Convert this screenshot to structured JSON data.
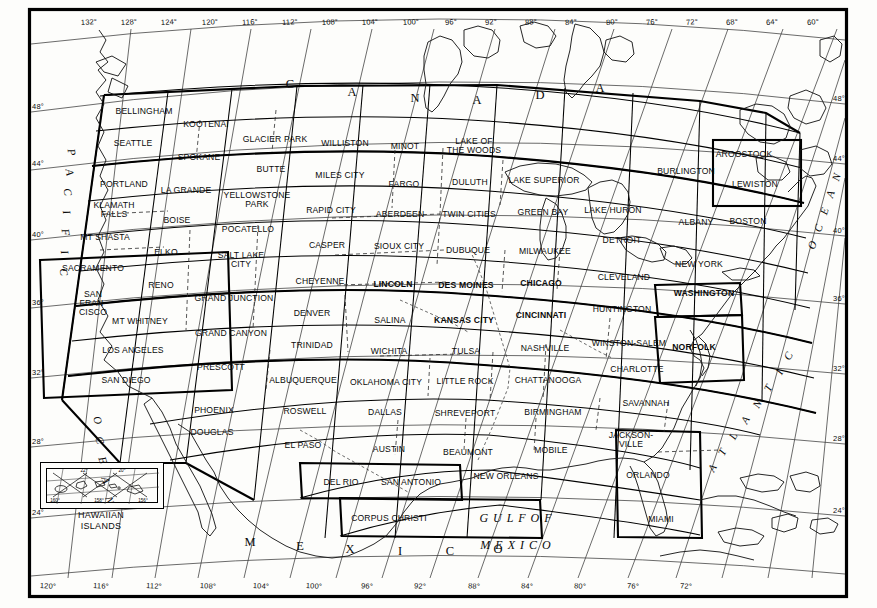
{
  "document": {
    "kind": "sectional-aeronautical-chart-index-map",
    "projection": "lambert-conformal-conic"
  },
  "graticule": {
    "longitude_top": [
      "132°",
      "128°",
      "124°",
      "120°",
      "116°",
      "112°",
      "108°",
      "104°",
      "100°",
      "96°",
      "92°",
      "88°",
      "84°",
      "80°",
      "76°",
      "72°",
      "68°",
      "64°",
      "60°"
    ],
    "longitude_bottom": [
      "120°",
      "116°",
      "112°",
      "108°",
      "104°",
      "100°",
      "96°",
      "92°",
      "88°",
      "84°",
      "80°",
      "76°",
      "72°"
    ],
    "latitude_left": [
      "48°",
      "44°",
      "40°",
      "36°",
      "32°",
      "28°",
      "24°"
    ],
    "latitude_right": [
      "48°",
      "44°",
      "40°",
      "36°",
      "32°",
      "28°",
      "24°"
    ]
  },
  "region_labels": {
    "canada": [
      "C",
      "A",
      "N",
      "A",
      "D",
      "A"
    ],
    "mexico": [
      "M",
      "E",
      "X",
      "I",
      "C",
      "O"
    ],
    "gulf_line1": "G U L F   O F",
    "gulf_line2": "M E X I C O",
    "pacific": [
      "P",
      "A",
      "C",
      "I",
      "F",
      "I",
      "C",
      "O",
      "C",
      "E",
      "A",
      "N"
    ],
    "atlantic_left": [
      "A",
      "T",
      "L",
      "A",
      "N",
      "T",
      "I",
      "C"
    ],
    "atlantic_right": [
      "O",
      "C",
      "E",
      "A",
      "N"
    ]
  },
  "inset": {
    "title_line1": "HAWAIIAN",
    "title_line2": "ISLANDS",
    "ticks_top": [
      "22°",
      "20°"
    ],
    "ticks_bottom": [
      "160°",
      "158°",
      "156°"
    ]
  },
  "charts": [
    {
      "name": "BELLINGHAM",
      "x": 144,
      "y": 111,
      "bold": false
    },
    {
      "name": "KOOTENAI",
      "x": 206,
      "y": 124,
      "bold": false
    },
    {
      "name": "GLACIER PARK",
      "x": 275,
      "y": 139,
      "bold": false
    },
    {
      "name": "WILLISTON",
      "x": 345,
      "y": 143,
      "bold": false
    },
    {
      "name": "MINOT",
      "x": 405,
      "y": 146,
      "bold": false
    },
    {
      "name": "LAKE OF",
      "x": 474,
      "y": 145,
      "bold": false,
      "line2": "THE WOODS"
    },
    {
      "name": "AROOSTOOK",
      "x": 744,
      "y": 154,
      "bold": false
    },
    {
      "name": "SEATTLE",
      "x": 133,
      "y": 143,
      "bold": false
    },
    {
      "name": "SPOKANE",
      "x": 199,
      "y": 157,
      "bold": false
    },
    {
      "name": "BUTTE",
      "x": 271,
      "y": 169,
      "bold": false
    },
    {
      "name": "MILES CITY",
      "x": 340,
      "y": 175,
      "bold": false
    },
    {
      "name": "FARGO",
      "x": 404,
      "y": 184,
      "bold": false
    },
    {
      "name": "DULUTH",
      "x": 470,
      "y": 182,
      "bold": false
    },
    {
      "name": "LAKE SUPERIOR",
      "x": 544,
      "y": 180,
      "bold": false
    },
    {
      "name": "BURLINGTON",
      "x": 686,
      "y": 171,
      "bold": false
    },
    {
      "name": "LEWISTON",
      "x": 755,
      "y": 184,
      "bold": false
    },
    {
      "name": "PORTLAND",
      "x": 124,
      "y": 184,
      "bold": false
    },
    {
      "name": "LA GRANDE",
      "x": 186,
      "y": 190,
      "bold": false
    },
    {
      "name": "YELLOWSTONE",
      "x": 257,
      "y": 199,
      "bold": false,
      "line2": "PARK"
    },
    {
      "name": "RAPID CITY",
      "x": 331,
      "y": 210,
      "bold": false
    },
    {
      "name": "ABERDEEN",
      "x": 400,
      "y": 214,
      "bold": false
    },
    {
      "name": "TWIN CITIES",
      "x": 469,
      "y": 214,
      "bold": false
    },
    {
      "name": "GREEN BAY",
      "x": 543,
      "y": 212,
      "bold": false
    },
    {
      "name": "LAKE HURON",
      "x": 613,
      "y": 210,
      "bold": false
    },
    {
      "name": "ALBANY",
      "x": 696,
      "y": 222,
      "bold": false
    },
    {
      "name": "BOSTON",
      "x": 748,
      "y": 221,
      "bold": false
    },
    {
      "name": "KLAMATH",
      "x": 114,
      "y": 209,
      "bold": false,
      "line2": "FALLS"
    },
    {
      "name": "BOISE",
      "x": 177,
      "y": 220,
      "bold": false
    },
    {
      "name": "POCATELLO",
      "x": 248,
      "y": 229,
      "bold": false
    },
    {
      "name": "CASPER",
      "x": 327,
      "y": 245,
      "bold": false
    },
    {
      "name": "SIOUX CITY",
      "x": 399,
      "y": 246,
      "bold": false
    },
    {
      "name": "DUBUQUE",
      "x": 468,
      "y": 250,
      "bold": false
    },
    {
      "name": "MILWAUKEE",
      "x": 545,
      "y": 251,
      "bold": false
    },
    {
      "name": "DETROIT",
      "x": 622,
      "y": 240,
      "bold": false
    },
    {
      "name": "NEW YORK",
      "x": 699,
      "y": 264,
      "bold": false
    },
    {
      "name": "MT SHASTA",
      "x": 105,
      "y": 237,
      "bold": false
    },
    {
      "name": "ELKO",
      "x": 166,
      "y": 252,
      "bold": false
    },
    {
      "name": "SALT LAKE",
      "x": 241,
      "y": 259,
      "bold": false,
      "line2": "CITY"
    },
    {
      "name": "CHEYENNE",
      "x": 320,
      "y": 281,
      "bold": false
    },
    {
      "name": "LINCOLN",
      "x": 393,
      "y": 284,
      "bold": true
    },
    {
      "name": "DES MOINES",
      "x": 466,
      "y": 285,
      "bold": true
    },
    {
      "name": "CHICAGO",
      "x": 541,
      "y": 283,
      "bold": true
    },
    {
      "name": "CLEVELAND",
      "x": 624,
      "y": 277,
      "bold": false
    },
    {
      "name": "WASHINGTON",
      "x": 704,
      "y": 293,
      "bold": true
    },
    {
      "name": "SACRAMENTO",
      "x": 93,
      "y": 268,
      "bold": false
    },
    {
      "name": "RENO",
      "x": 161,
      "y": 285,
      "bold": false
    },
    {
      "name": "GRAND JUNCTION",
      "x": 234,
      "y": 298,
      "bold": false
    },
    {
      "name": "DENVER",
      "x": 312,
      "y": 313,
      "bold": false
    },
    {
      "name": "SALINA",
      "x": 390,
      "y": 320,
      "bold": false
    },
    {
      "name": "KANSAS CITY",
      "x": 464,
      "y": 320,
      "bold": true
    },
    {
      "name": "CINCINNATI",
      "x": 541,
      "y": 315,
      "bold": true
    },
    {
      "name": "HUNTINGTON",
      "x": 622,
      "y": 309,
      "bold": false
    },
    {
      "name": "NORFOLK",
      "x": 694,
      "y": 347,
      "bold": true
    },
    {
      "name": "SAN",
      "x": 93,
      "y": 303,
      "bold": false,
      "line2": "FRAN-",
      "line3": "CISCO"
    },
    {
      "name": "MT WHITNEY",
      "x": 140,
      "y": 321,
      "bold": false
    },
    {
      "name": "GRAND CANYON",
      "x": 231,
      "y": 333,
      "bold": false
    },
    {
      "name": "TRINIDAD",
      "x": 312,
      "y": 345,
      "bold": false
    },
    {
      "name": "WICHITA",
      "x": 389,
      "y": 351,
      "bold": false
    },
    {
      "name": "TULSA",
      "x": 466,
      "y": 351,
      "bold": false
    },
    {
      "name": "NASHVILLE",
      "x": 545,
      "y": 348,
      "bold": false
    },
    {
      "name": "WINSTON-SALEM",
      "x": 629,
      "y": 343,
      "bold": false
    },
    {
      "name": "LOS ANGELES",
      "x": 133,
      "y": 350,
      "bold": false
    },
    {
      "name": "PRESCOTT",
      "x": 221,
      "y": 367,
      "bold": false
    },
    {
      "name": "ALBUQUERQUE",
      "x": 303,
      "y": 380,
      "bold": false
    },
    {
      "name": "OKLAHOMA CITY",
      "x": 386,
      "y": 382,
      "bold": false
    },
    {
      "name": "LITTLE ROCK",
      "x": 465,
      "y": 381,
      "bold": false
    },
    {
      "name": "CHATTANOOGA",
      "x": 548,
      "y": 380,
      "bold": false
    },
    {
      "name": "CHARLOTTE",
      "x": 637,
      "y": 369,
      "bold": false
    },
    {
      "name": "SAN DIEGO",
      "x": 126,
      "y": 380,
      "bold": false
    },
    {
      "name": "PHOENIX",
      "x": 214,
      "y": 410,
      "bold": false
    },
    {
      "name": "ROSWELL",
      "x": 305,
      "y": 411,
      "bold": false
    },
    {
      "name": "DALLAS",
      "x": 385,
      "y": 412,
      "bold": false
    },
    {
      "name": "SHREVEPORT",
      "x": 465,
      "y": 413,
      "bold": false
    },
    {
      "name": "BIRMINGHAM",
      "x": 553,
      "y": 412,
      "bold": false
    },
    {
      "name": "SAVANNAH",
      "x": 646,
      "y": 403,
      "bold": false
    },
    {
      "name": "DOUGLAS",
      "x": 212,
      "y": 432,
      "bold": false
    },
    {
      "name": "EL PASO",
      "x": 303,
      "y": 445,
      "bold": false
    },
    {
      "name": "AUSTIN",
      "x": 389,
      "y": 449,
      "bold": false
    },
    {
      "name": "BEAUMONT",
      "x": 468,
      "y": 452,
      "bold": false
    },
    {
      "name": "MOBILE",
      "x": 551,
      "y": 450,
      "bold": false
    },
    {
      "name": "JACKSON-",
      "x": 631,
      "y": 439,
      "bold": false,
      "line2": "VILLE"
    },
    {
      "name": "DEL RIO",
      "x": 341,
      "y": 482,
      "bold": false
    },
    {
      "name": "SAN ANTONIO",
      "x": 411,
      "y": 482,
      "bold": false
    },
    {
      "name": "NEW ORLEANS",
      "x": 506,
      "y": 476,
      "bold": false
    },
    {
      "name": "ORLANDO",
      "x": 648,
      "y": 475,
      "bold": false
    },
    {
      "name": "CORPUS CHRISTI",
      "x": 389,
      "y": 518,
      "bold": false
    },
    {
      "name": "MIAMI",
      "x": 661,
      "y": 519,
      "bold": false
    }
  ]
}
